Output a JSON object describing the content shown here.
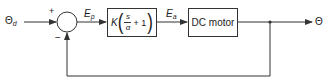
{
  "diagram": {
    "type": "feedback-control-block-diagram",
    "input": {
      "symbol": "Θ",
      "subscript": "d"
    },
    "summing_junction": {
      "plus_sign": "+",
      "minus_sign": "−"
    },
    "error_signal": {
      "symbol": "E",
      "subscript": "p"
    },
    "controller_block": {
      "gain": "K",
      "numerator": "s",
      "denominator": "α",
      "plus_one": "+ 1"
    },
    "actuator_signal": {
      "symbol": "E",
      "subscript": "a"
    },
    "plant_block": {
      "label": "DC motor"
    },
    "output": {
      "symbol": "Θ"
    },
    "feedback": "unity negative feedback"
  },
  "colors": {
    "line": "#333333",
    "background": "#ffffff",
    "text": "#222222"
  }
}
